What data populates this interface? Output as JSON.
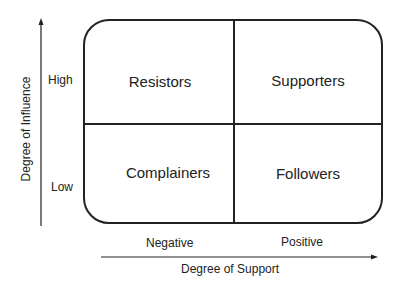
{
  "quadrants": {
    "top_left": "Resistors",
    "top_right": "Supporters",
    "bottom_left": "Complainers",
    "bottom_right": "Followers"
  },
  "y_axis": {
    "title": "Degree of Influence",
    "ticks": [
      "High",
      "Low"
    ]
  },
  "x_axis": {
    "title": "Degree of Support",
    "ticks": [
      "Negative",
      "Positive"
    ]
  }
}
